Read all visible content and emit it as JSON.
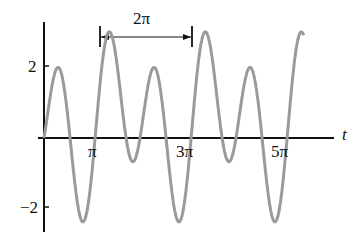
{
  "chart_data": {
    "type": "line",
    "title": "",
    "xlabel": "t",
    "ylabel": "",
    "x_ticks": [
      "π",
      "3π",
      "5π"
    ],
    "x_tick_values": [
      3.14159,
      9.42478,
      15.70796
    ],
    "y_ticks": [
      "2",
      "−2"
    ],
    "y_tick_values": [
      2,
      -2
    ],
    "xlim": [
      0,
      17.2
    ],
    "ylim": [
      -2.8,
      3.0
    ],
    "grid": false,
    "legend": null,
    "annotation": {
      "text": "2π",
      "type": "period-arrow",
      "from_x": 3.5,
      "to_x": 9.8
    },
    "series": [
      {
        "name": "periodic signal",
        "description": "2π-periodic waveform with alternating large (~2.4) and small (~1.5) peaks and alternating deep (~-2.5) and shallow (~-1.5) troughs",
        "color": "#9a9a9a",
        "formula_approx": "2*sin(2t-0.5) - sin(t-0.5) + 0.48",
        "t_range": [
          0,
          17.0
        ],
        "key_points": [
          {
            "t": 0.0,
            "y": 0.0
          },
          {
            "t": 1.26,
            "y": 1.5
          },
          {
            "t": 2.6,
            "y": -2.5
          },
          {
            "t": 3.6,
            "y": 2.4
          },
          {
            "t": 5.3,
            "y": -1.5
          },
          {
            "t": 7.5,
            "y": 1.5
          },
          {
            "t": 8.9,
            "y": -2.5
          },
          {
            "t": 9.9,
            "y": 2.4
          },
          {
            "t": 11.6,
            "y": -1.5
          },
          {
            "t": 13.8,
            "y": 1.5
          },
          {
            "t": 15.2,
            "y": -2.5
          },
          {
            "t": 16.2,
            "y": 2.4
          }
        ]
      }
    ]
  },
  "labels": {
    "y_tick_2": "2",
    "y_tick_neg2": "−2",
    "x_tick_pi": "π",
    "x_tick_3pi": "3π",
    "x_tick_5pi": "5π",
    "x_axis": "t",
    "period": "2π"
  }
}
